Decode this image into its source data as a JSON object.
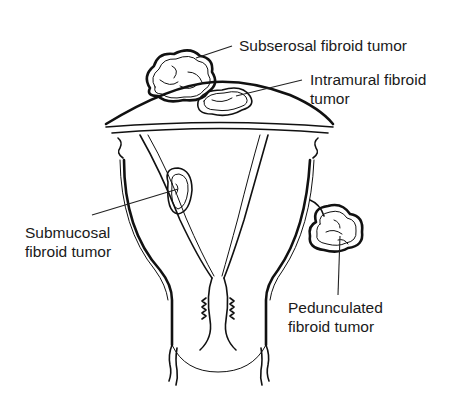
{
  "diagram": {
    "labels": [
      {
        "id": "subserosal",
        "lines": [
          "Subserosal fibroid tumor"
        ]
      },
      {
        "id": "intramural",
        "lines": [
          "Intramural fibroid",
          "tumor"
        ]
      },
      {
        "id": "submucosal",
        "lines": [
          "Submucosal",
          "fibroid tumor"
        ]
      },
      {
        "id": "pedunculated",
        "lines": [
          "Pedunculated",
          "fibroid tumor"
        ]
      }
    ],
    "colors": {
      "background": "#ffffff",
      "ink": "#111111",
      "text": "#1a1a1a"
    }
  }
}
